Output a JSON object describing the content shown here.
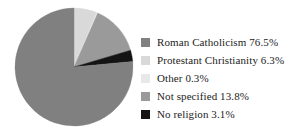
{
  "chart_data": {
    "type": "pie",
    "title": "",
    "subtitle": "",
    "xlabel": "",
    "ylabel": "",
    "legend_position": "right",
    "grid": false,
    "start_angle_deg": 0,
    "direction": "clockwise",
    "categories": [
      "Roman Catholicism",
      "Protestant Christianity",
      "Other",
      "Not specified",
      "No religion"
    ],
    "values": [
      76.5,
      6.3,
      0.3,
      13.8,
      3.1
    ],
    "value_unit": "%",
    "colors": [
      "#808080",
      "#d9d9d9",
      "#e8e8e8",
      "#9a9a9a",
      "#141414"
    ],
    "slice_order_clockwise_from_top": [
      "Protestant Christianity",
      "Other",
      "Not specified",
      "No religion",
      "Roman Catholicism"
    ]
  },
  "legend": {
    "items": [
      {
        "label": "Roman Catholicism 76.5%",
        "name": "Roman Catholicism",
        "value": "76.5%",
        "color": "#808080"
      },
      {
        "label": "Protestant Christianity 6.3%",
        "name": "Protestant Christianity",
        "value": "6.3%",
        "color": "#d9d9d9"
      },
      {
        "label": "Other 0.3%",
        "name": "Other",
        "value": "0.3%",
        "color": "#e8e8e8"
      },
      {
        "label": "Not specified 13.8%",
        "name": "Not specified",
        "value": "13.8%",
        "color": "#9a9a9a"
      },
      {
        "label": "No religion 3.1%",
        "name": "No religion",
        "value": "3.1%",
        "color": "#141414"
      }
    ]
  }
}
